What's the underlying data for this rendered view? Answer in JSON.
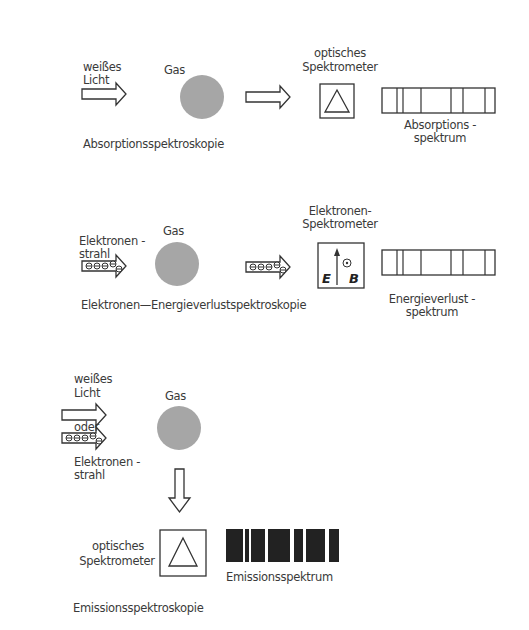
{
  "rows": [
    {
      "source_label": [
        "weißes",
        "Licht"
      ],
      "gas_label": "Gas",
      "method_label": "Absorptionsspektroskopie",
      "spectrometer_label": [
        "optisches",
        "Spektrometer"
      ],
      "spectrum_label": [
        "Absorptions -",
        "spektrum"
      ],
      "spectrometer_type": "prism",
      "spectrum_type": "absorption"
    },
    {
      "source_label": [
        "Elektronen -",
        "strahl"
      ],
      "gas_label": "Gas",
      "method_label": "Elektronen—Energieverlustspektroskopie",
      "spectrometer_label": [
        "Elektronen-",
        "Spektrometer"
      ],
      "spectrometer_symbols": {
        "e_field": "E",
        "b_field": "B"
      },
      "spectrum_label": [
        "Energieverlust -",
        "spektrum"
      ],
      "spectrometer_type": "electron",
      "spectrum_type": "energy-loss"
    },
    {
      "source_label": [
        "weißes",
        "Licht"
      ],
      "or_label": "oder",
      "source_label_2": [
        "Elektronen -",
        "strahl"
      ],
      "gas_label": "Gas",
      "method_label": "Emissionsspektroskopie",
      "spectrometer_label": [
        "optisches",
        "Spektrometer"
      ],
      "spectrum_label": "Emissionsspektrum",
      "spectrometer_type": "prism",
      "spectrum_type": "emission"
    }
  ],
  "colors": {
    "line": "#333333",
    "gas": "#a6a6a6",
    "emission": "#222222"
  }
}
